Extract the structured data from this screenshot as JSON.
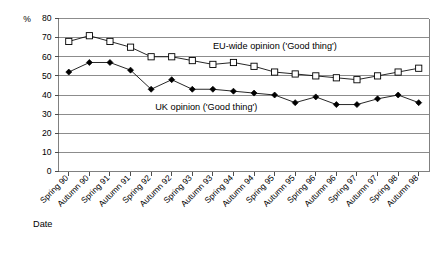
{
  "chart_data": {
    "type": "line",
    "title": "",
    "xlabel": "Date",
    "ylabel": "%",
    "ylim": [
      0,
      80
    ],
    "ytick_step": 10,
    "grid": true,
    "legend": "inline-annotations",
    "categories": [
      "Spring 90",
      "Autumn 90",
      "Spring 91",
      "Autumn 91",
      "Spring 92",
      "Autumn 92",
      "Spring 93",
      "Autumn 93",
      "Spring 94",
      "Autumn 94",
      "Spring 95",
      "Autumn 95",
      "Spring 96",
      "Autumn 96",
      "Spring 97",
      "Autumn 97",
      "Spring 98",
      "Autumn 98"
    ],
    "yticks": [
      0,
      10,
      20,
      30,
      40,
      50,
      60,
      70,
      80
    ],
    "series": [
      {
        "name": "EU-wide opinion ('Good thing')",
        "marker": "open-square",
        "values": [
          68,
          71,
          68,
          65,
          60,
          60,
          58,
          56,
          57,
          55,
          52,
          51,
          50,
          49,
          48,
          50,
          52,
          54
        ]
      },
      {
        "name": "UK opinion ('Good thing')",
        "marker": "filled-diamond",
        "values": [
          52,
          57,
          57,
          53,
          43,
          48,
          43,
          43,
          42,
          41,
          40,
          36,
          39,
          35,
          35,
          38,
          40,
          36
        ]
      }
    ],
    "annotations": [
      {
        "text": "EU-wide opinion ('Good thing')",
        "x_index": 7.0,
        "y_value": 64
      },
      {
        "text": "UK opinion ('Good thing')",
        "x_index": 4.2,
        "y_value": 32
      }
    ],
    "colors": {
      "line": "#000000",
      "grid": "#808080",
      "axis": "#808080",
      "text": "#000000",
      "background": "#ffffff"
    }
  }
}
